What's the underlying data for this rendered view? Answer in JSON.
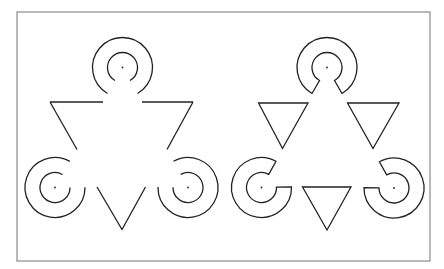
{
  "figure": {
    "colors": {
      "ink": "#222222",
      "frame": "#8a8a8a",
      "background": "#ffffff"
    },
    "panels": [
      {
        "name": "left-figure",
        "style": "open-arcs-and-line-segments",
        "inducers": [
          {
            "name": "top",
            "notch_direction": "down"
          },
          {
            "name": "bottom-left",
            "notch_direction": "up-right"
          },
          {
            "name": "bottom-right",
            "notch_direction": "up-left"
          }
        ],
        "line_segments": "outline of inverted triangle with gaps"
      },
      {
        "name": "right-figure",
        "style": "closed-notched-rings-and-small-triangles",
        "inducers": [
          {
            "name": "top",
            "notch_direction": "down"
          },
          {
            "name": "bottom-left",
            "notch_direction": "up-right"
          },
          {
            "name": "bottom-right",
            "notch_direction": "up-left"
          }
        ],
        "triangles": [
          "upper-left",
          "upper-right",
          "bottom-center"
        ]
      }
    ]
  }
}
